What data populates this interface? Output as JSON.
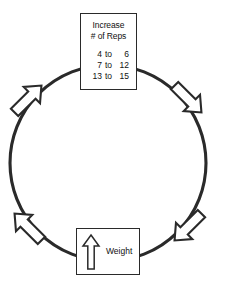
{
  "diagram": {
    "type": "cycle-flow-diagram",
    "title": "",
    "stroke_color": "#2a2a2a",
    "fill_color": "#ffffff",
    "background": "#ffffff",
    "direction": "clockwise",
    "circle": {
      "center_x": 108,
      "center_y": 163,
      "radius": 98
    },
    "nodes": [
      {
        "id": "increase-reps",
        "position": "top",
        "title_line_1": "Increase",
        "title_line_2": "# of Reps",
        "rows": [
          {
            "from": "4",
            "connector": "to",
            "to": "6"
          },
          {
            "from": "7",
            "connector": "to",
            "to": "12"
          },
          {
            "from": "13",
            "connector": "to",
            "to": "15"
          }
        ]
      },
      {
        "id": "increase-weight",
        "position": "bottom",
        "label": "Weight",
        "icon": "up-arrow-outline-icon"
      }
    ],
    "arrows": [
      {
        "id": "arrow-upper-left",
        "angle_deg": 215,
        "points": "up-right",
        "icon": "flow-arrow-icon"
      },
      {
        "id": "arrow-upper-right",
        "angle_deg": 325,
        "points": "down-right",
        "icon": "flow-arrow-icon"
      },
      {
        "id": "arrow-lower-right",
        "angle_deg": 35,
        "points": "down-left",
        "icon": "flow-arrow-icon"
      },
      {
        "id": "arrow-lower-left",
        "angle_deg": 145,
        "points": "up-left",
        "icon": "flow-arrow-icon"
      }
    ]
  }
}
